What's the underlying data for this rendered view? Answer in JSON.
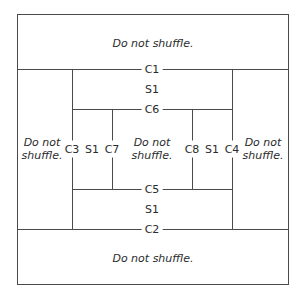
{
  "diagram": {
    "regions": {
      "top": "Do not shuffle.",
      "bottom": "Do not shuffle.",
      "left": [
        "Do not",
        "shuffle."
      ],
      "middle": [
        "Do not",
        "shuffle."
      ],
      "right": [
        "Do not",
        "shuffle."
      ]
    },
    "cuts": {
      "c1": "C1",
      "c2": "C2",
      "c3": "C3",
      "c4": "C4",
      "c5": "C5",
      "c6": "C6",
      "c7": "C7",
      "c8": "C8"
    },
    "shuffles": {
      "top": "S1",
      "bottom": "S1",
      "left": "S1",
      "right": "S1"
    },
    "colors": {
      "line": "#4a4a4a",
      "text": "#2b2b2b",
      "background": "#ffffff"
    }
  }
}
